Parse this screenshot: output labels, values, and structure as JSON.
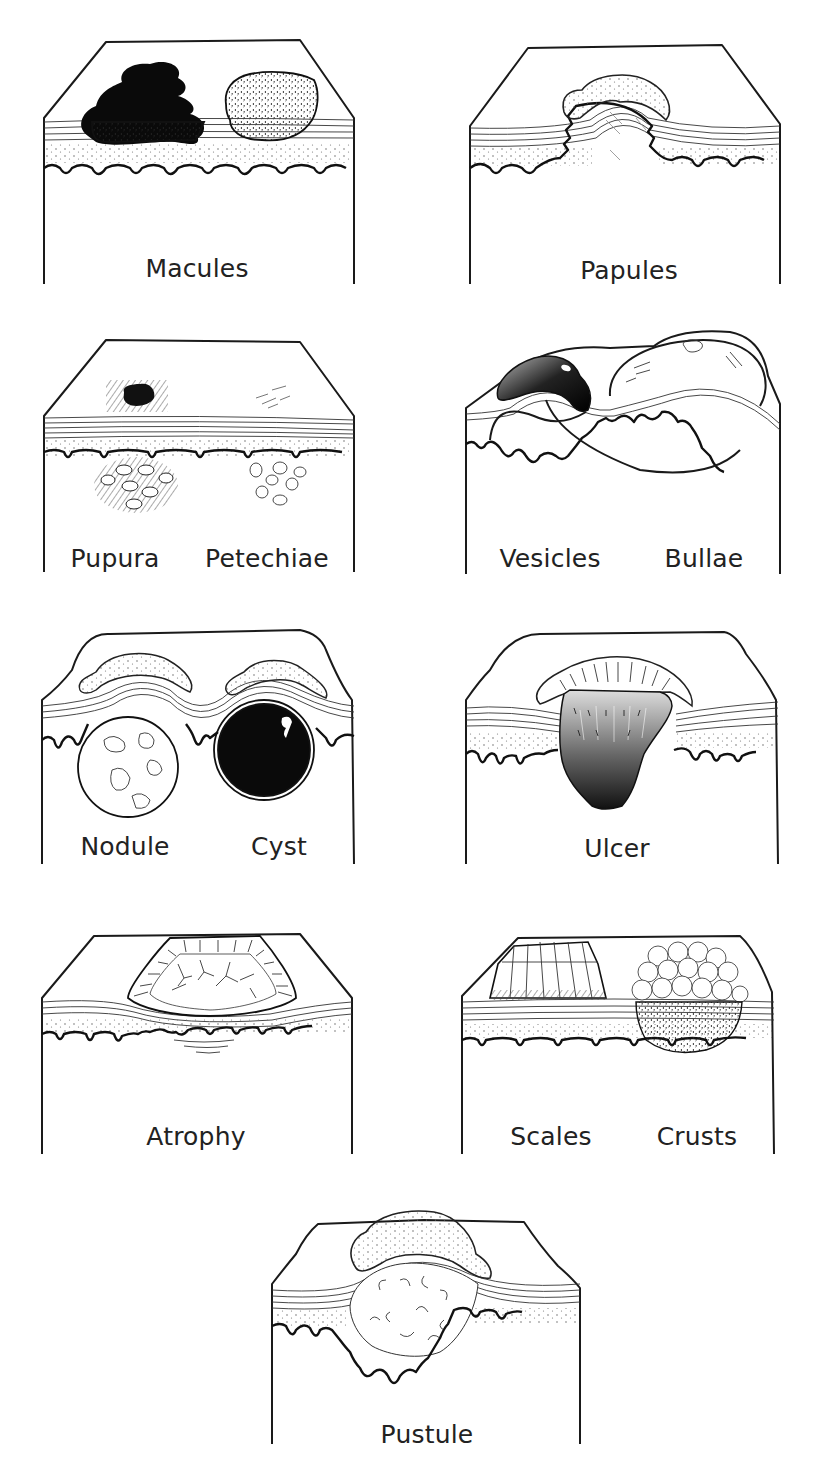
{
  "figure": {
    "type": "diagram",
    "panels": [
      {
        "id": "macules",
        "labels": [
          "Macules"
        ]
      },
      {
        "id": "papules",
        "labels": [
          "Papules"
        ]
      },
      {
        "id": "purpura-petechiae",
        "labels": [
          "Pupura",
          "Petechiae"
        ]
      },
      {
        "id": "vesicles-bullae",
        "labels": [
          "Vesicles",
          "Bullae"
        ]
      },
      {
        "id": "nodule-cyst",
        "labels": [
          "Nodule",
          "Cyst"
        ]
      },
      {
        "id": "ulcer",
        "labels": [
          "Ulcer"
        ]
      },
      {
        "id": "atrophy",
        "labels": [
          "Atrophy"
        ]
      },
      {
        "id": "scales-crusts",
        "labels": [
          "Scales",
          "Crusts"
        ]
      },
      {
        "id": "pustule",
        "labels": [
          "Pustule"
        ]
      }
    ]
  },
  "colors": {
    "ink": "#1a1a1a",
    "background": "#ffffff",
    "lesion_dark": "#111111"
  }
}
